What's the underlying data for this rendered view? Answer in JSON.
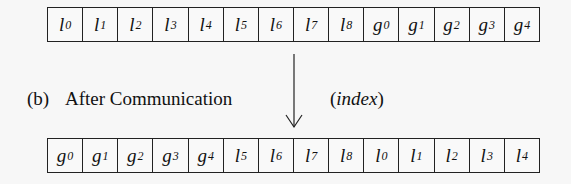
{
  "diagram": {
    "before_row": {
      "cells": [
        {
          "base": "l",
          "sub": "0"
        },
        {
          "base": "l",
          "sub": "1"
        },
        {
          "base": "l",
          "sub": "2"
        },
        {
          "base": "l",
          "sub": "3"
        },
        {
          "base": "l",
          "sub": "4"
        },
        {
          "base": "l",
          "sub": "5"
        },
        {
          "base": "l",
          "sub": "6"
        },
        {
          "base": "l",
          "sub": "7"
        },
        {
          "base": "l",
          "sub": "8"
        },
        {
          "base": "g",
          "sub": "0"
        },
        {
          "base": "g",
          "sub": "1"
        },
        {
          "base": "g",
          "sub": "2"
        },
        {
          "base": "g",
          "sub": "3"
        },
        {
          "base": "g",
          "sub": "4"
        }
      ]
    },
    "caption": {
      "marker": "(b)",
      "title": "After Communication"
    },
    "arrow": {
      "direction": "down",
      "label_open": "(",
      "label_text": "index",
      "label_close": ")"
    },
    "after_row": {
      "cells": [
        {
          "base": "g",
          "sub": "0"
        },
        {
          "base": "g",
          "sub": "1"
        },
        {
          "base": "g",
          "sub": "2"
        },
        {
          "base": "g",
          "sub": "3"
        },
        {
          "base": "g",
          "sub": "4"
        },
        {
          "base": "l",
          "sub": "5"
        },
        {
          "base": "l",
          "sub": "6"
        },
        {
          "base": "l",
          "sub": "7"
        },
        {
          "base": "l",
          "sub": "8"
        },
        {
          "base": "l",
          "sub": "0"
        },
        {
          "base": "l",
          "sub": "1"
        },
        {
          "base": "l",
          "sub": "2"
        },
        {
          "base": "l",
          "sub": "3"
        },
        {
          "base": "l",
          "sub": "4"
        }
      ]
    }
  }
}
